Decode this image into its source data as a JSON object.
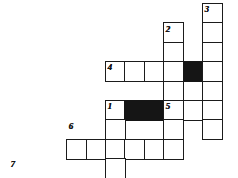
{
  "puzzle": {
    "type": "crossword-grid",
    "title": "Crossword puzzle grid",
    "cell_size": 19.5,
    "colors": {
      "grid_line": "#1b1b1b",
      "empty_cell": "#ffffff",
      "blocked_cell": "#151515",
      "background": "#ffffff",
      "number": "#101010"
    },
    "clue_numbers": [
      {
        "label": "3",
        "col": 10,
        "row": 0
      },
      {
        "label": "2",
        "col": 8,
        "row": 1
      },
      {
        "label": "4",
        "col": 5,
        "row": 3
      },
      {
        "label": "1",
        "col": 5,
        "row": 5
      },
      {
        "label": "5",
        "col": 8,
        "row": 5
      },
      {
        "label": "6",
        "col": 3,
        "row": 6
      },
      {
        "label": "7",
        "col": 0,
        "row": 8
      }
    ],
    "cells": [
      {
        "col": 10,
        "row": 0,
        "blocked": false
      },
      {
        "col": 10,
        "row": 1,
        "blocked": false
      },
      {
        "col": 8,
        "row": 1,
        "blocked": false
      },
      {
        "col": 10,
        "row": 2,
        "blocked": false
      },
      {
        "col": 8,
        "row": 2,
        "blocked": false
      },
      {
        "col": 5,
        "row": 3,
        "blocked": false
      },
      {
        "col": 6,
        "row": 3,
        "blocked": false
      },
      {
        "col": 7,
        "row": 3,
        "blocked": false
      },
      {
        "col": 8,
        "row": 3,
        "blocked": false
      },
      {
        "col": 9,
        "row": 3,
        "blocked": true
      },
      {
        "col": 10,
        "row": 3,
        "blocked": false
      },
      {
        "col": 8,
        "row": 4,
        "blocked": false
      },
      {
        "col": 10,
        "row": 4,
        "blocked": false
      },
      {
        "col": 5,
        "row": 5,
        "blocked": false
      },
      {
        "col": 6,
        "row": 5,
        "blocked": true
      },
      {
        "col": 7,
        "row": 5,
        "blocked": true
      },
      {
        "col": 8,
        "row": 5,
        "blocked": false
      },
      {
        "col": 9,
        "row": 5,
        "blocked": false
      },
      {
        "col": 10,
        "row": 5,
        "blocked": false
      },
      {
        "col": 5,
        "row": 6,
        "blocked": false
      },
      {
        "col": 8,
        "row": 6,
        "blocked": false
      },
      {
        "col": 10,
        "row": 6,
        "blocked": false
      },
      {
        "col": 3,
        "row": 7,
        "blocked": false
      },
      {
        "col": 4,
        "row": 7,
        "blocked": false
      },
      {
        "col": 5,
        "row": 7,
        "blocked": false
      },
      {
        "col": 6,
        "row": 7,
        "blocked": false
      },
      {
        "col": 7,
        "row": 7,
        "blocked": false
      },
      {
        "col": 8,
        "row": 7,
        "blocked": false
      },
      {
        "col": 5,
        "row": 8,
        "blocked": false
      },
      {
        "col": 0,
        "row": 9,
        "blocked": false
      },
      {
        "col": 1,
        "row": 9,
        "blocked": false
      },
      {
        "col": 2,
        "row": 9,
        "blocked": false
      },
      {
        "col": 3,
        "row": 9,
        "blocked": false
      },
      {
        "col": 4,
        "row": 9,
        "blocked": false
      },
      {
        "col": 5,
        "row": 9,
        "blocked": false
      }
    ],
    "geometry": {
      "origin_x": 8,
      "origin_y": 3,
      "step": 19.4
    }
  }
}
